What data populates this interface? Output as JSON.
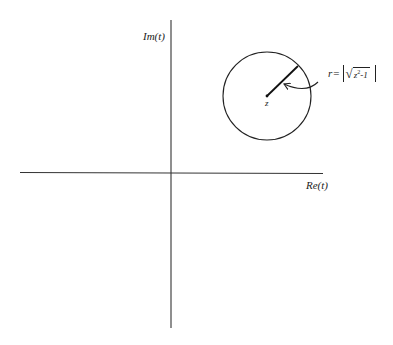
{
  "diagram": {
    "type": "complex-plane-illustration",
    "axes": {
      "horizontal_label": "Re(t)",
      "vertical_label": "Im(t)"
    },
    "point": {
      "label": "z"
    },
    "circle": {
      "radius_label_prefix": "r",
      "radius_label_equals": "=",
      "radius_formula_text": "r=|√(z²−1)|",
      "radicand_base": "z",
      "radicand_exponent": "2",
      "radicand_rest": "-1",
      "radical_sign": "√"
    },
    "colors": {
      "ink": "#222222",
      "background": "#ffffff"
    }
  }
}
